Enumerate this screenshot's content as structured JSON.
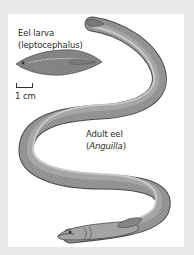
{
  "figure": {
    "larva_label_line1": "Eel larva",
    "larva_label_line2": "(leptocephalus)",
    "scale_label": "1 cm",
    "adult_label_line1": "Adult eel",
    "adult_label_open": "(",
    "adult_label_genus": "Anguilla",
    "adult_label_close": ")"
  },
  "colors": {
    "background": "#e9e9e9",
    "panel": "#ffffff",
    "body_fill": "#9a9a9a",
    "body_dark": "#6e6e6e",
    "body_light": "#c4c4c4",
    "text": "#2a2a2a"
  }
}
